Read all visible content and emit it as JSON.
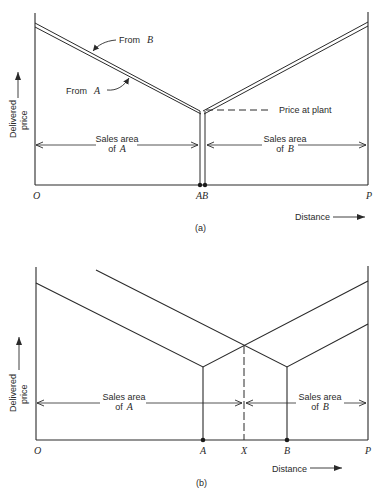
{
  "figure": {
    "panel_a": {
      "caption": "(a)",
      "y_axis_label_line1": "Delivered",
      "y_axis_label_line2": "price",
      "x_axis_label": "Distance",
      "origin_label": "O",
      "end_label": "P",
      "plant_label": "AB",
      "from_b_label_prefix": "From",
      "from_b_label_var": "B",
      "from_a_label_prefix": "From",
      "from_a_label_var": "A",
      "price_at_plant_label": "Price at plant",
      "sales_area_a_line1": "Sales area",
      "sales_area_a_line2_prefix": "of",
      "sales_area_a_line2_var": "A",
      "sales_area_b_line1": "Sales area",
      "sales_area_b_line2_prefix": "of",
      "sales_area_b_line2_var": "B"
    },
    "panel_b": {
      "caption": "(b)",
      "y_axis_label_line1": "Delivered",
      "y_axis_label_line2": "price",
      "x_axis_label": "Distance",
      "origin_label": "O",
      "a_label": "A",
      "x_label": "X",
      "b_label": "B",
      "end_label": "P",
      "sales_area_a_line1": "Sales area",
      "sales_area_a_line2_prefix": "of",
      "sales_area_a_line2_var": "A",
      "sales_area_b_line1": "Sales area",
      "sales_area_b_line2_prefix": "of",
      "sales_area_b_line2_var": "B"
    }
  }
}
